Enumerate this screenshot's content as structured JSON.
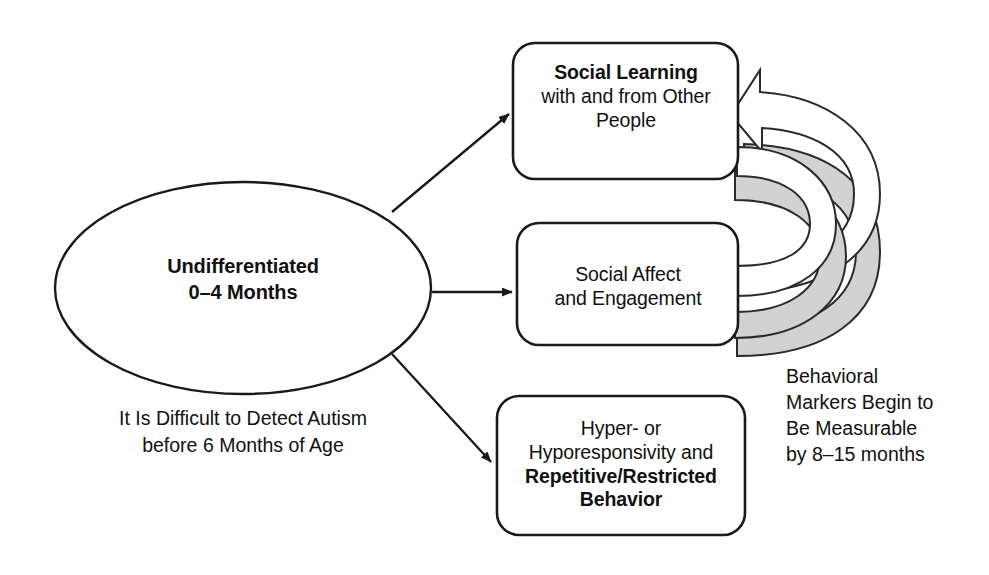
{
  "diagram": {
    "colors": {
      "stroke": "#1a1a1a",
      "text": "#111111",
      "arrow_fill": "#ffffff",
      "arrow_shadow_fill": "#d2d2d2",
      "background": "#ffffff"
    },
    "origin_node": {
      "shape": "ellipse",
      "line1": "Undifferentiated",
      "line2": "0–4 Months"
    },
    "outcome_nodes": [
      {
        "id": "social-learning",
        "shape": "rounded-rectangle",
        "lines": [
          {
            "text": "Social Learning",
            "bold": true
          },
          {
            "text": "with and from Other",
            "bold": false
          },
          {
            "text": "People",
            "bold": false
          }
        ]
      },
      {
        "id": "social-affect",
        "shape": "rounded-rectangle",
        "lines": [
          {
            "text": "Social Affect",
            "bold": false
          },
          {
            "text": "and Engagement",
            "bold": false
          }
        ]
      },
      {
        "id": "repetitive-behavior",
        "shape": "rounded-rectangle",
        "lines": [
          {
            "text": "Hyper- or",
            "bold": false
          },
          {
            "text": "Hyporesponsivity and",
            "bold": false
          },
          {
            "text": "Repetitive/Restricted",
            "bold": true
          },
          {
            "text": "Behavior",
            "bold": true
          }
        ]
      }
    ],
    "captions": {
      "left": {
        "lines": [
          "It Is Difficult to Detect Autism",
          "before 6 Months of Age"
        ]
      },
      "right": {
        "lines": [
          "Behavioral",
          "Markers Begin to",
          "Be Measurable",
          "by 8–15 months"
        ]
      }
    },
    "connectors": [
      {
        "id": "ellipse-to-social-learning",
        "from": "origin",
        "to": "social-learning",
        "style": "straight-arrow"
      },
      {
        "id": "ellipse-to-social-affect",
        "from": "origin",
        "to": "social-affect",
        "style": "straight-arrow"
      },
      {
        "id": "ellipse-to-repetitive-behavior",
        "from": "origin",
        "to": "repetitive-behavior",
        "style": "straight-arrow"
      },
      {
        "id": "repetitive-to-social-learning",
        "from": "repetitive-behavior",
        "to": "social-learning",
        "style": "curved-block-arrow"
      },
      {
        "id": "social-affect-to-social-learning",
        "from": "social-affect",
        "to": "social-affect-loop",
        "style": "curved-block-arrow"
      }
    ]
  }
}
